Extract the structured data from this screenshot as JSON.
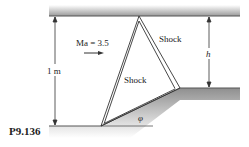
{
  "figure": {
    "id": "P9.136",
    "mach_label": "Ma = 3.5",
    "shock_upper_label": "Shock",
    "shock_lower_label": "Shock",
    "height_dim_label": "1 m",
    "step_dim_label": "h",
    "angle_label": "φ"
  },
  "colors": {
    "wall_dark": "#9a9a9a",
    "wall_light": "#ffffff",
    "line": "#333333"
  }
}
